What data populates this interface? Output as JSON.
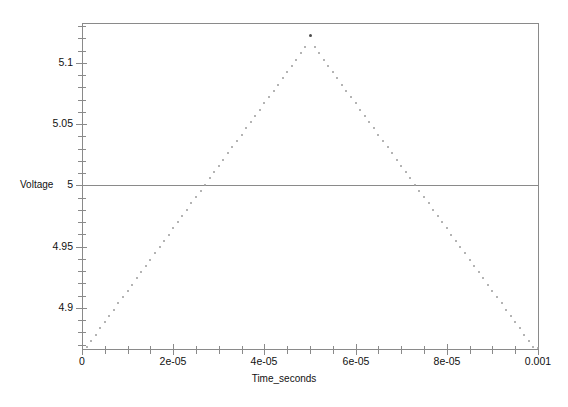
{
  "chart_data": {
    "type": "scatter",
    "title": "",
    "xlabel": "Time_seconds",
    "ylabel": "Voltage",
    "xlim": [
      0,
      0.0001
    ],
    "ylim": [
      4.8665,
      5.1325
    ],
    "grid": false,
    "legend": null,
    "marker_style": "small dotted points",
    "marker_color": "#9b9b9b",
    "reference_line_y": 5,
    "x_ticks": [
      {
        "value": 0,
        "label": "0"
      },
      {
        "value": 2e-05,
        "label": "2e-05"
      },
      {
        "value": 4e-05,
        "label": "4e-05"
      },
      {
        "value": 6e-05,
        "label": "6e-05"
      },
      {
        "value": 8e-05,
        "label": "8e-05"
      },
      {
        "value": 0.0001,
        "label": "0.001"
      }
    ],
    "x_minor_tick_step": 5e-06,
    "y_ticks": [
      {
        "value": 5.1,
        "label": "5.1"
      },
      {
        "value": 5.05,
        "label": "5.05"
      },
      {
        "value": 5,
        "label": "5"
      },
      {
        "value": 4.95,
        "label": "4.95"
      },
      {
        "value": 4.9,
        "label": "4.9"
      }
    ],
    "y_minor_tick_step": 0.01,
    "annotations": [],
    "x": [
      1e-06,
      2e-06,
      3e-06,
      4e-06,
      5e-06,
      6e-06,
      7e-06,
      8e-06,
      9e-06,
      1e-05,
      1.1e-05,
      1.2e-05,
      1.3e-05,
      1.4e-05,
      1.5e-05,
      1.6e-05,
      1.7e-05,
      1.8e-05,
      1.9e-05,
      2e-05,
      2.1e-05,
      2.2e-05,
      2.3e-05,
      2.4e-05,
      2.5e-05,
      2.6e-05,
      2.7e-05,
      2.8e-05,
      2.9e-05,
      3e-05,
      3.1e-05,
      3.2e-05,
      3.3e-05,
      3.4e-05,
      3.5e-05,
      3.6e-05,
      3.7e-05,
      3.8e-05,
      3.9e-05,
      4e-05,
      4.1e-05,
      4.2e-05,
      4.3e-05,
      4.4e-05,
      4.5e-05,
      4.6e-05,
      4.7e-05,
      4.8e-05,
      4.9e-05,
      5e-05,
      5.1e-05,
      5.2e-05,
      5.3e-05,
      5.4e-05,
      5.5e-05,
      5.6e-05,
      5.7e-05,
      5.8e-05,
      5.9e-05,
      6e-05,
      6.1e-05,
      6.2e-05,
      6.3e-05,
      6.4e-05,
      6.5e-05,
      6.6e-05,
      6.7e-05,
      6.8e-05,
      6.9e-05,
      7e-05,
      7.1e-05,
      7.2e-05,
      7.3e-05,
      7.4e-05,
      7.5e-05,
      7.6e-05,
      7.7e-05,
      7.8e-05,
      7.9e-05,
      8e-05,
      8.1e-05,
      8.2e-05,
      8.3e-05,
      8.4e-05,
      8.5e-05,
      8.6e-05,
      8.7e-05,
      8.8e-05,
      8.9e-05,
      9e-05,
      9.1e-05,
      9.2e-05,
      9.3e-05,
      9.4e-05,
      9.5e-05,
      9.6e-05,
      9.7e-05,
      9.8e-05,
      9.9e-05,
      0.0001
    ],
    "y": [
      4.868,
      4.8731,
      4.8782,
      4.8833,
      4.8884,
      4.8935,
      4.8986,
      4.9037,
      4.9088,
      4.9139,
      4.919,
      4.9241,
      4.9292,
      4.9343,
      4.9394,
      4.9445,
      4.9496,
      4.9547,
      4.9598,
      4.9649,
      4.97,
      4.9751,
      4.9802,
      4.9853,
      4.9904,
      4.9955,
      5.0006,
      5.0057,
      5.0108,
      5.0159,
      5.021,
      5.0261,
      5.0312,
      5.0363,
      5.0414,
      5.0465,
      5.0516,
      5.0567,
      5.0618,
      5.0669,
      5.072,
      5.0771,
      5.0822,
      5.0873,
      5.0924,
      5.0975,
      5.1026,
      5.1077,
      5.1128,
      5.122,
      5.1128,
      5.1077,
      5.1026,
      5.0975,
      5.0924,
      5.0873,
      5.0822,
      5.0771,
      5.072,
      5.0669,
      5.0618,
      5.0567,
      5.0516,
      5.0465,
      5.0414,
      5.0363,
      5.0312,
      5.0261,
      5.021,
      5.0159,
      5.0108,
      5.0057,
      5.0006,
      4.9955,
      4.9904,
      4.9853,
      4.9802,
      4.9751,
      4.97,
      4.9649,
      4.9598,
      4.9547,
      4.9496,
      4.9445,
      4.9394,
      4.9343,
      4.9292,
      4.9241,
      4.919,
      4.9139,
      4.9088,
      4.9037,
      4.8986,
      4.8935,
      4.8884,
      4.8833,
      4.8782,
      4.8731,
      4.868,
      4.867
    ],
    "peak": {
      "x": 5e-05,
      "y": 5.122
    }
  },
  "axes": {
    "y_title": "Voltage",
    "x_title": "Time_seconds"
  },
  "colors": {
    "axis": "#8a8a8a",
    "text": "#111111",
    "marker": "#9b9b9b",
    "peak_marker": "#4d4d4d",
    "background": "#ffffff"
  }
}
